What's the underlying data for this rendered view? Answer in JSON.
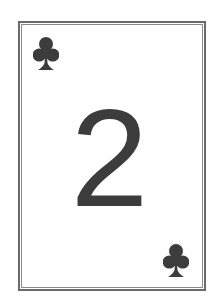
{
  "card": {
    "rank": "2",
    "suit": "clubs",
    "suit_icon": "club-icon",
    "colors": {
      "ink": "#3c3c3c",
      "border": "#6a6a6a",
      "background": "#ffffff"
    }
  }
}
